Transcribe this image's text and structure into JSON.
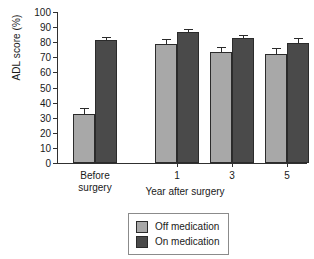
{
  "chart_data": {
    "type": "bar",
    "title": "",
    "xlabel": "Year after surgery",
    "ylabel": "ADL score (%)",
    "ylim": [
      0,
      100
    ],
    "ytick_step": 10,
    "yticks": [
      100,
      90,
      80,
      70,
      60,
      50,
      40,
      30,
      20,
      10,
      0
    ],
    "grid": false,
    "legend_position": "bottom-center",
    "categories": [
      "Before surgery",
      "1",
      "3",
      "5"
    ],
    "series": [
      {
        "name": "Off medication",
        "color": "#a8a8a8",
        "values": [
          32.5,
          79.0,
          73.5,
          72.0
        ],
        "errors": [
          3.0,
          2.5,
          3.0,
          3.5
        ]
      },
      {
        "name": "On medication",
        "color": "#4a4a4a",
        "values": [
          81.5,
          86.5,
          82.5,
          79.5
        ],
        "errors": [
          1.5,
          1.5,
          1.5,
          2.5
        ]
      }
    ]
  },
  "axes": {
    "ylabel": "ADL score (%)",
    "xlabel": "Year after surgery",
    "ytick_labels": [
      "100",
      "90",
      "80",
      "70",
      "60",
      "50",
      "40",
      "30",
      "20",
      "10",
      "0"
    ],
    "xcat_labels": [
      [
        "Before",
        "surgery"
      ],
      [
        "1"
      ],
      [
        "3"
      ],
      [
        "5"
      ]
    ]
  },
  "legend": {
    "items": [
      {
        "label": "Off medication",
        "color": "#a8a8a8"
      },
      {
        "label": "On medication",
        "color": "#4a4a4a"
      }
    ]
  },
  "colors": {
    "off_medication": "#a8a8a8",
    "on_medication": "#4a4a4a",
    "axis": "#303030",
    "bar_outline": "#2b2b2b",
    "legend_border": "#8b8b8b",
    "background": "#ffffff"
  }
}
